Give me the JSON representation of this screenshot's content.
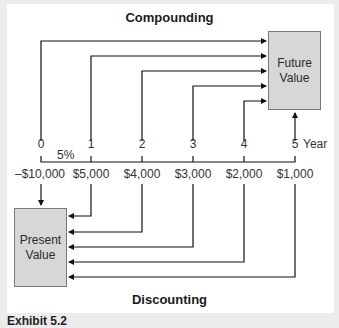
{
  "diagram": {
    "top_title": "Compounding",
    "bottom_title": "Discounting",
    "future_value_box": {
      "line1": "Future",
      "line2": "Value"
    },
    "present_value_box": {
      "line1": "Present",
      "line2": "Value"
    },
    "interest_rate": "5%",
    "year_axis_label": "Year",
    "timeline": [
      {
        "year": "0",
        "cash_flow": "–$10,000"
      },
      {
        "year": "1",
        "cash_flow": "$5,000"
      },
      {
        "year": "2",
        "cash_flow": "$4,000"
      },
      {
        "year": "3",
        "cash_flow": "$3,000"
      },
      {
        "year": "4",
        "cash_flow": "$2,000"
      },
      {
        "year": "5",
        "cash_flow": "$1,000"
      }
    ],
    "caption": "Exhibit 5.2"
  },
  "colors": {
    "background": "#ececec",
    "panel": "#ffffff",
    "box_fill": "#d7d7d7",
    "box_border": "#7a7a7a",
    "line": "#111111"
  }
}
